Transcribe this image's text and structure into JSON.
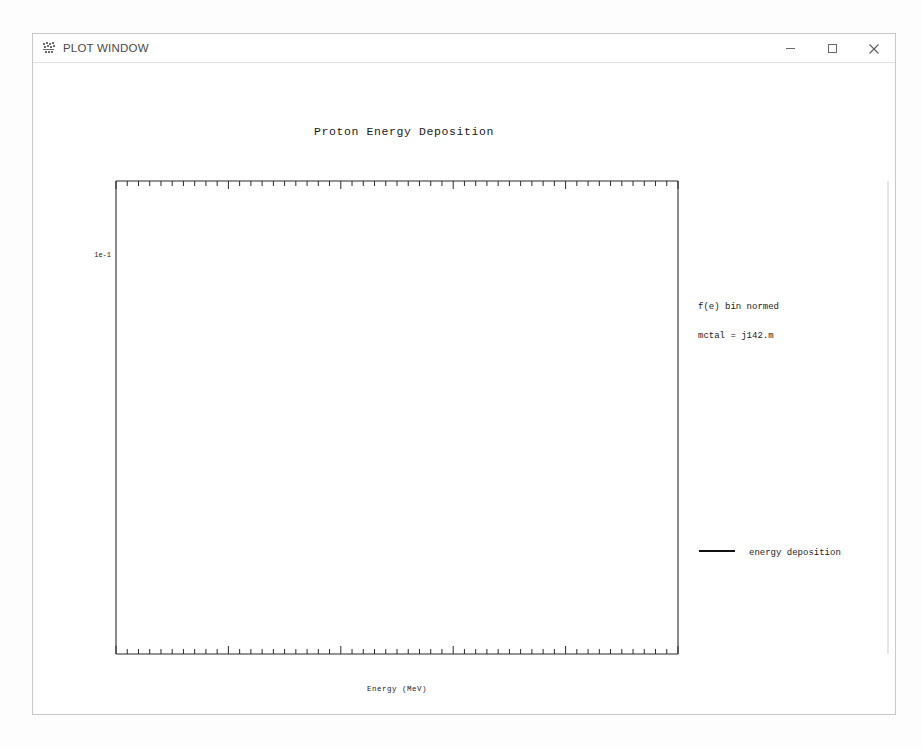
{
  "window": {
    "title": "PLOT WINDOW",
    "icon": "mcnp-plot-icon",
    "controls": {
      "minimize": "minimize-icon",
      "maximize": "maximize-icon",
      "close": "close-icon"
    }
  },
  "plot": {
    "title": "Proton Energy Deposition",
    "xlabel": "Energy (MeV)",
    "ylabel": "Tally/MeV/Particle",
    "ylabel_chars": [
      "T",
      "a",
      "l",
      "l",
      "y",
      "/",
      "M",
      "e",
      "V",
      "/",
      "P",
      "a",
      "r",
      "t",
      "i",
      "c",
      "l",
      "e"
    ],
    "y_tick_label": "1e-1",
    "x_tick_labels": [
      "0",
      "2",
      "4",
      "6",
      "8",
      "10"
    ],
    "axis_color": "#2b2b2b",
    "curve_color": "#111111"
  },
  "info": {
    "header_rows": [
      {
        "label": "mcnp",
        "value": "6"
      },
      {
        "label": "probid:",
        "value": ""
      },
      {
        "label": "tally",
        "value": "26"
      },
      {
        "label": "h",
        "value": ""
      },
      {
        "label": "nps",
        "value": "100000"
      }
    ],
    "norm_note": "f(e) bin normed",
    "mctal": "mctal = j142.m",
    "bin_rows": [
      {
        "key": "f",
        "name": "Cell",
        "value": "1"
      },
      {
        "key": "d",
        "name": "Flag/Dir",
        "value": "1"
      },
      {
        "key": "u",
        "name": "User",
        "value": "1"
      },
      {
        "key": "s",
        "name": "Segment",
        "value": "1"
      },
      {
        "key": "m",
        "name": "Mult",
        "value": "1"
      },
      {
        "key": "c",
        "name": "Angle",
        "value": "1"
      },
      {
        "key": "e",
        "name": "Energy",
        "value": "*"
      },
      {
        "key": "t",
        "name": "Time",
        "value": "1"
      }
    ],
    "legend": {
      "swatch": "line-swatch",
      "label": "energy deposition"
    }
  },
  "chart_data": {
    "type": "line",
    "subtype": "step-histogram-with-errorbars",
    "title": "Proton Energy Deposition",
    "xlabel": "Energy (MeV)",
    "ylabel": "Tally/MeV/Particle",
    "xlim": [
      0,
      10
    ],
    "xscale": "linear",
    "yscale": "log",
    "ylim": [
      0.0135,
      0.42
    ],
    "y_ticks_labeled": [
      0.1
    ],
    "y_tick_labels": [
      "1e-1"
    ],
    "x_major_ticks": [
      0,
      2,
      4,
      6,
      8,
      10
    ],
    "x_minor_tick_step": 0.2,
    "grid": false,
    "legend_position": "right-panel",
    "series": [
      {
        "name": "energy deposition",
        "bin_edges": [
          0.0,
          0.2,
          0.4,
          0.6,
          0.8,
          1.0,
          1.2,
          1.4,
          1.6,
          1.8,
          2.0,
          2.2,
          2.4,
          2.6,
          2.8,
          3.0,
          3.2,
          3.4,
          3.6,
          3.8,
          4.0,
          4.2,
          4.4,
          4.6,
          4.8,
          5.0,
          5.2,
          5.4,
          5.6,
          5.8,
          6.0,
          6.2,
          6.4,
          6.6,
          6.8,
          7.0,
          7.2,
          7.4,
          7.6,
          7.8,
          8.0,
          8.2,
          8.4,
          8.6,
          8.8,
          9.0,
          9.2,
          9.4,
          9.6,
          9.8,
          10.0
        ],
        "values": [
          0.276,
          0.232,
          0.221,
          0.196,
          0.186,
          0.176,
          0.168,
          0.16,
          0.152,
          0.147,
          0.138,
          0.131,
          0.124,
          0.118,
          0.126,
          0.106,
          0.112,
          0.101,
          0.0975,
          0.094,
          0.0855,
          0.0985,
          0.0935,
          0.07,
          0.069,
          0.079,
          0.0755,
          0.073,
          0.0745,
          0.06,
          0.0575,
          0.062,
          0.0625,
          0.064,
          0.051,
          0.0495,
          0.049,
          0.049,
          0.0495,
          0.05,
          0.0435,
          0.052,
          0.041,
          0.0185,
          0.029,
          0.036,
          0.033,
          0.0155,
          0.0225,
          0.03
        ],
        "errors": [
          0.008,
          0.006,
          0.006,
          0.005,
          0.005,
          0.005,
          0.005,
          0.004,
          0.004,
          0.004,
          0.004,
          0.004,
          0.004,
          0.003,
          0.004,
          0.003,
          0.003,
          0.003,
          0.003,
          0.003,
          0.003,
          0.003,
          0.003,
          0.003,
          0.003,
          0.003,
          0.003,
          0.003,
          0.003,
          0.003,
          0.003,
          0.003,
          0.003,
          0.003,
          0.002,
          0.002,
          0.002,
          0.002,
          0.002,
          0.002,
          0.002,
          0.003,
          0.002,
          0.002,
          0.002,
          0.003,
          0.003,
          0.002,
          0.002,
          0.003
        ]
      }
    ]
  }
}
